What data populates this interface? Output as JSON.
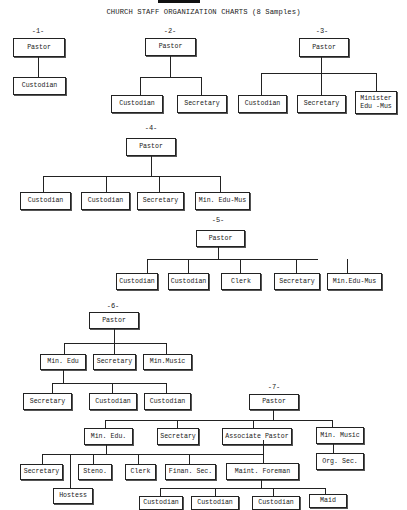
{
  "document": {
    "title": "CHURCH STAFF ORGANIZATION CHARTS (8 Samples)"
  },
  "charts": [
    {
      "number": "-1-",
      "root": "Pastor",
      "children": [
        "Custodian"
      ]
    },
    {
      "number": "-2-",
      "root": "Pastor",
      "children": [
        "Custodian",
        "Secretary"
      ]
    },
    {
      "number": "-3-",
      "root": "Pastor",
      "children": [
        "Custodian",
        "Secretary",
        "Minister Edu -Mus"
      ],
      "child_lines": [
        "Minister",
        "Edu -Mus"
      ]
    },
    {
      "number": "-4-",
      "root": "Pastor",
      "children": [
        "Custodian",
        "Custodian",
        "Secretary",
        "Min. Edu-Mus"
      ]
    },
    {
      "number": "-5-",
      "root": "Pastor",
      "children": [
        "Custodian",
        "Custodian",
        "Clerk",
        "Secretary",
        "Min.Edu-Mus"
      ]
    },
    {
      "number": "-6-",
      "root": "Pastor",
      "children": [
        "Min. Edu",
        "Secretary",
        "Min.Music"
      ],
      "min_edu_children": [
        "Secretary",
        "Custodian",
        "Custodian"
      ]
    },
    {
      "number": "-7-",
      "root": "Pastor",
      "children": [
        "Min. Edu.",
        "Secretary",
        "Associate Pastor",
        "Min. Music"
      ],
      "min_edu_children": [
        "Secretary",
        "Hostess",
        "Steno.",
        "Clerk",
        "Finan. Sec.",
        "Maint. Foreman"
      ],
      "maint_foreman_children": [
        "Custodian",
        "Custodian",
        "Custodian",
        "Maid"
      ],
      "min_music_children": [
        "Org. Sec."
      ]
    }
  ]
}
